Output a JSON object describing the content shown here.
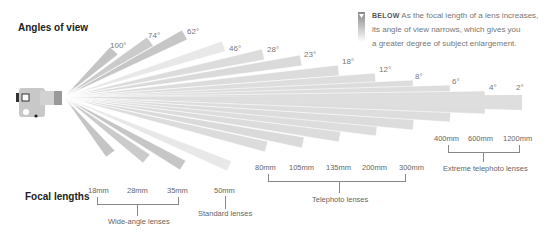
{
  "title_angles": "Angles of view",
  "title_focal": "Focal lengths",
  "caption": {
    "tag": "BELOW",
    "text": "As the focal length of a lens increases, its angle of view narrows, which gives you a greater degree of subject enlargement.",
    "lines": [
      "As the focal length of a lens increases,",
      "its angle of view narrows, which gives you",
      "a greater degree of subject enlargement."
    ]
  },
  "lenses": [
    {
      "angle": "100°",
      "focal": "18mm"
    },
    {
      "angle": "74°",
      "focal": "28mm"
    },
    {
      "angle": "62°",
      "focal": "35mm"
    },
    {
      "angle": "46°",
      "focal": "50mm"
    },
    {
      "angle": "28°",
      "focal": "80mm"
    },
    {
      "angle": "23°",
      "focal": "105mm"
    },
    {
      "angle": "18°",
      "focal": "135mm"
    },
    {
      "angle": "12°",
      "focal": "200mm"
    },
    {
      "angle": "8°",
      "focal": "300mm"
    },
    {
      "angle": "6°",
      "focal": "400mm"
    },
    {
      "angle": "4°",
      "focal": "600mm"
    },
    {
      "angle": "2°",
      "focal": "1200mm"
    }
  ],
  "groups": {
    "wide": "Wide-angle lenses",
    "standard": "Standard lenses",
    "tele": "Telephoto lenses",
    "extreme": "Extreme telephoto lenses"
  },
  "icons": {
    "camera": "camera-icon",
    "marker": "triangle-down-icon"
  }
}
